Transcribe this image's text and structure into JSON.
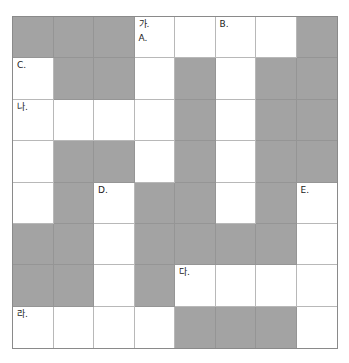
{
  "puzzle": {
    "rows": 8,
    "cols": 8,
    "colors": {
      "filled": "#a3a3a3",
      "open": "#ffffff",
      "border": "#8a8a8a"
    },
    "grid": [
      [
        "B",
        "B",
        "B",
        "W",
        "W",
        "W",
        "W",
        "B"
      ],
      [
        "W",
        "B",
        "B",
        "W",
        "B",
        "W",
        "B",
        "B"
      ],
      [
        "W",
        "W",
        "W",
        "W",
        "B",
        "W",
        "B",
        "B"
      ],
      [
        "W",
        "B",
        "B",
        "W",
        "B",
        "W",
        "B",
        "B"
      ],
      [
        "W",
        "B",
        "W",
        "B",
        "B",
        "W",
        "B",
        "W"
      ],
      [
        "B",
        "B",
        "W",
        "B",
        "B",
        "B",
        "B",
        "W"
      ],
      [
        "B",
        "B",
        "W",
        "B",
        "W",
        "W",
        "W",
        "W"
      ],
      [
        "W",
        "W",
        "W",
        "W",
        "B",
        "B",
        "B",
        "W"
      ]
    ],
    "labels": [
      {
        "row": 0,
        "col": 3,
        "texts": [
          "가.",
          "A."
        ]
      },
      {
        "row": 0,
        "col": 5,
        "texts": [
          "B."
        ]
      },
      {
        "row": 1,
        "col": 0,
        "texts": [
          "C."
        ]
      },
      {
        "row": 2,
        "col": 0,
        "texts": [
          "나."
        ]
      },
      {
        "row": 4,
        "col": 2,
        "texts": [
          "D."
        ]
      },
      {
        "row": 4,
        "col": 7,
        "texts": [
          "E."
        ]
      },
      {
        "row": 6,
        "col": 4,
        "texts": [
          "다."
        ]
      },
      {
        "row": 7,
        "col": 0,
        "texts": [
          "라."
        ]
      }
    ]
  }
}
